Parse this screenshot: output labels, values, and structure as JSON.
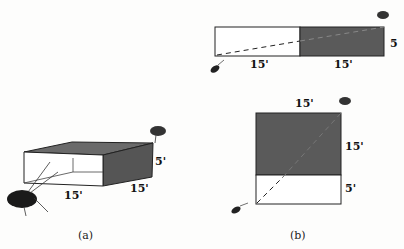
{
  "panels": [
    {
      "caption": "(a)",
      "type": "3d-box",
      "labels": {
        "width": "15'",
        "depth": "15'",
        "height": "5'"
      }
    },
    {
      "caption": "(b)",
      "type": "unfolded-nets",
      "net_horizontal": {
        "left_width": "15'",
        "right_width": "15'",
        "height": "5"
      },
      "net_vertical": {
        "top_width": "15'",
        "top_height": "15'",
        "bottom_height": "5'"
      }
    }
  ],
  "colors": {
    "shaded": "#5a5a5a",
    "outline": "#222222",
    "bug": "#1a1a1a"
  }
}
